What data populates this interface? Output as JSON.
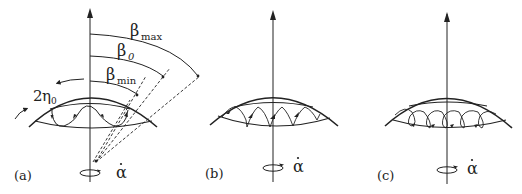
{
  "panels": [
    {
      "id": "a",
      "label": "(a)",
      "rate_symbol": "α",
      "angles": {
        "beta_max": {
          "symbol": "β",
          "subscript": "max"
        },
        "beta_0": {
          "symbol": "β",
          "subscript": "0"
        },
        "beta_min": {
          "symbol": "β",
          "subscript": "min"
        }
      },
      "width_label": {
        "prefix": "2",
        "symbol": "η",
        "subscript": "0"
      },
      "trajectory": "meandering"
    },
    {
      "id": "b",
      "label": "(b)",
      "rate_symbol": "α",
      "trajectory": "cusped"
    },
    {
      "id": "c",
      "label": "(c)",
      "rate_symbol": "α",
      "trajectory": "looping"
    }
  ],
  "colors": {
    "line": "#222222",
    "background": "#ffffff"
  }
}
